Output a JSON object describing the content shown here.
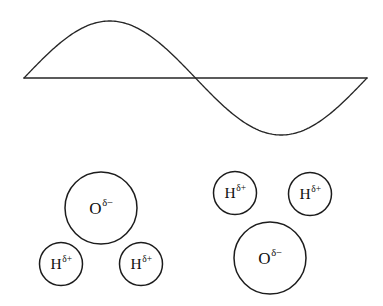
{
  "figure": {
    "background_color": "#ffffff",
    "stroke_color": "#262626",
    "width": 383,
    "height": 306
  },
  "wave": {
    "name": "sine-wave",
    "description": "One full sinusoidal cycle drawn above a horizontal baseline",
    "baseline_y": 78,
    "x_start": 24,
    "x_end": 367,
    "crest": {
      "x": 82,
      "y": 21
    },
    "zero_crossing": {
      "x": 190,
      "y": 78
    },
    "trough": {
      "x": 295,
      "y": 127
    },
    "amplitude": 57,
    "cycles": 1
  },
  "molecules": [
    {
      "name": "water-molecule-left",
      "orientation": "oxygen-up",
      "atoms": [
        {
          "name": "oxygen-atom",
          "symbol": "O",
          "charge": "δ−",
          "cx": 101,
          "cy": 208,
          "r": 36,
          "size": "large"
        },
        {
          "name": "hydrogen-atom-left",
          "symbol": "H",
          "charge": "δ+",
          "cx": 61,
          "cy": 264,
          "r": 21.5,
          "size": "small"
        },
        {
          "name": "hydrogen-atom-right",
          "symbol": "H",
          "charge": "δ+",
          "cx": 141,
          "cy": 264,
          "r": 21.5,
          "size": "small"
        }
      ]
    },
    {
      "name": "water-molecule-right",
      "orientation": "oxygen-down",
      "atoms": [
        {
          "name": "hydrogen-atom-left",
          "symbol": "H",
          "charge": "δ+",
          "cx": 235,
          "cy": 193,
          "r": 21.5,
          "size": "small"
        },
        {
          "name": "hydrogen-atom-right",
          "symbol": "H",
          "charge": "δ+",
          "cx": 310,
          "cy": 194,
          "r": 21.5,
          "size": "small"
        },
        {
          "name": "oxygen-atom",
          "symbol": "O",
          "charge": "δ−",
          "cx": 270,
          "cy": 258,
          "r": 36,
          "size": "large"
        }
      ]
    }
  ]
}
